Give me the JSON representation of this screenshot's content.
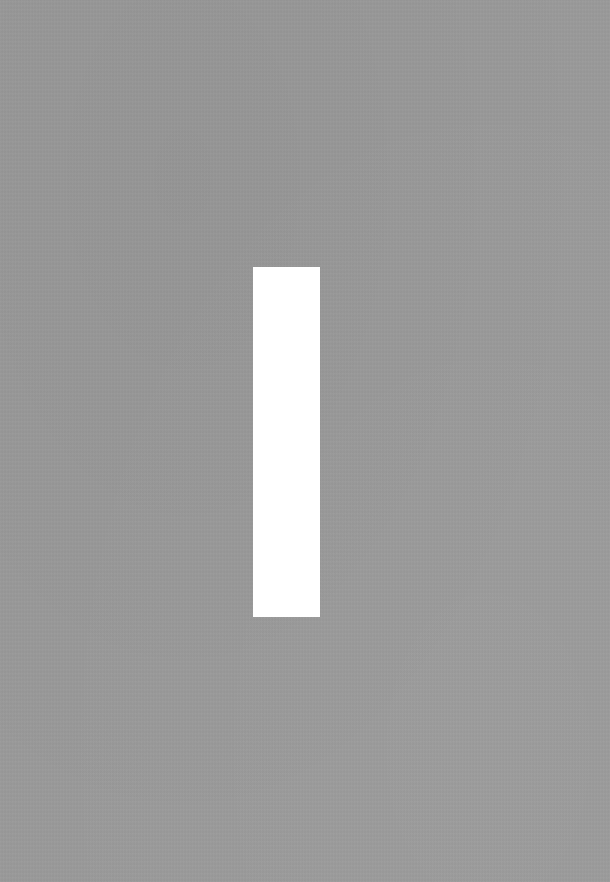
{
  "background": {
    "color": "#9a9a9a",
    "texture": "paper-grain"
  },
  "shapes": [
    {
      "type": "rectangle",
      "color": "#ffffff",
      "x": 253,
      "y": 267,
      "width": 67,
      "height": 350
    }
  ]
}
